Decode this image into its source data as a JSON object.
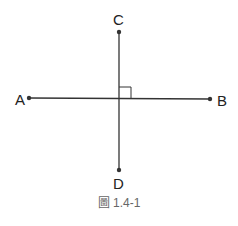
{
  "diagram": {
    "points": {
      "A": {
        "label": "A"
      },
      "B": {
        "label": "B"
      },
      "C": {
        "label": "C"
      },
      "D": {
        "label": "D"
      }
    },
    "segments": [
      "AB",
      "CD"
    ],
    "right_angle_marker": "at intersection of AB and CD",
    "caption": "圖 1.4-1",
    "line_color": "#333333"
  }
}
